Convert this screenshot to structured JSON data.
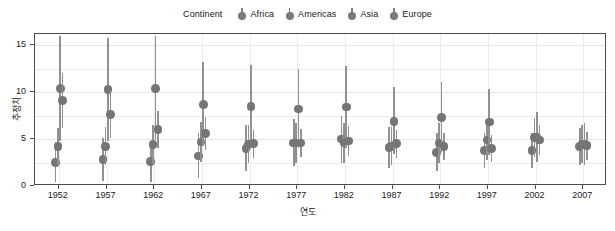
{
  "legend": {
    "title": "Continent",
    "items": [
      {
        "label": "Africa",
        "color": "#7a7a7a",
        "icon": "point-marker-icon"
      },
      {
        "label": "Americas",
        "color": "#7a7a7a",
        "icon": "point-marker-icon"
      },
      {
        "label": "Asia",
        "color": "#7a7a7a",
        "icon": "point-marker-icon"
      },
      {
        "label": "Europe",
        "color": "#7a7a7a",
        "icon": "point-marker-icon"
      }
    ],
    "position": "top"
  },
  "axes": {
    "x_title": "연도",
    "y_title": "추정치",
    "y_ticks": [
      "0",
      "5",
      "10",
      "15"
    ],
    "x_ticks": [
      "1952",
      "1957",
      "1962",
      "1967",
      "1972",
      "1977",
      "1982",
      "1987",
      "1992",
      "1997",
      "2002",
      "2007"
    ]
  },
  "chart_data": {
    "type": "scatter",
    "title": "",
    "subtitle": "",
    "xlabel": "연도",
    "ylabel": "추정치",
    "xlim": [
      1949.5,
      2009.5
    ],
    "ylim": [
      0,
      16.2
    ],
    "grid": true,
    "legend_position": "top",
    "legend_title": "Continent",
    "marker": "pointrange",
    "dodge": true,
    "categories": [
      1952,
      1957,
      1962,
      1967,
      1972,
      1977,
      1982,
      1987,
      1992,
      1997,
      2002,
      2007
    ],
    "series": [
      {
        "name": "Africa",
        "color": "#7a7a7a",
        "values": [
          2.5,
          2.8,
          2.6,
          3.2,
          4.0,
          4.6,
          5.0,
          4.1,
          3.6,
          3.8,
          3.8,
          4.2
        ],
        "lower": [
          0.4,
          0.5,
          0.4,
          0.8,
          1.6,
          2.1,
          2.5,
          1.9,
          1.6,
          1.9,
          1.9,
          2.2
        ],
        "upper": [
          4.7,
          5.1,
          4.8,
          5.6,
          6.5,
          7.1,
          7.5,
          6.3,
          5.7,
          5.7,
          5.7,
          6.2
        ]
      },
      {
        "name": "Americas",
        "color": "#7a7a7a",
        "values": [
          4.2,
          4.2,
          4.4,
          4.7,
          4.4,
          4.6,
          4.6,
          4.2,
          4.6,
          4.9,
          5.2,
          4.4
        ],
        "lower": [
          2.2,
          2.2,
          2.3,
          2.6,
          2.4,
          2.5,
          2.5,
          2.2,
          2.5,
          2.8,
          3.1,
          2.4
        ],
        "upper": [
          6.2,
          6.3,
          6.5,
          6.8,
          6.5,
          6.7,
          6.7,
          6.3,
          6.7,
          7.0,
          7.3,
          6.5
        ]
      },
      {
        "name": "Asia",
        "color": "#7a7a7a",
        "values": [
          10.4,
          10.3,
          10.4,
          8.7,
          8.5,
          8.2,
          8.4,
          6.9,
          7.3,
          6.8,
          5.2,
          4.4
        ],
        "lower": [
          4.8,
          4.8,
          4.9,
          4.3,
          4.1,
          4.0,
          4.1,
          3.4,
          3.6,
          3.3,
          2.6,
          2.2
        ],
        "upper": [
          16.0,
          15.8,
          16.0,
          13.2,
          12.9,
          12.5,
          12.8,
          10.5,
          11.1,
          10.3,
          7.9,
          6.7
        ]
      },
      {
        "name": "Europe",
        "color": "#7a7a7a",
        "values": [
          9.1,
          7.6,
          6.0,
          5.6,
          4.5,
          4.6,
          4.8,
          4.5,
          4.2,
          4.0,
          4.9,
          4.3
        ],
        "lower": [
          6.2,
          5.1,
          4.0,
          3.8,
          3.0,
          3.1,
          3.2,
          3.0,
          2.8,
          2.6,
          3.3,
          2.8
        ],
        "upper": [
          12.0,
          10.1,
          8.0,
          7.4,
          6.0,
          6.1,
          6.4,
          6.0,
          5.6,
          5.4,
          6.5,
          5.8
        ]
      }
    ]
  }
}
